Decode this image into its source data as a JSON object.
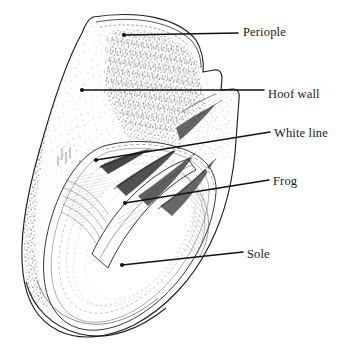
{
  "figure": {
    "subject": "hoof",
    "view": "sole view",
    "style": "pen-and-ink stipple and hatching line art",
    "background_color": "#ffffff",
    "ink_color": "#1a1a1a",
    "width": 349,
    "height": 353
  },
  "labels": [
    {
      "id": "periople",
      "text": "Periople",
      "leader": {
        "dot_x": 124,
        "dot_y": 35,
        "end_x": 238,
        "end_y": 33
      }
    },
    {
      "id": "hoof-wall",
      "text": "Hoof wall",
      "leader": {
        "dot_x": 82,
        "dot_y": 90,
        "end_x": 264,
        "end_y": 90
      }
    },
    {
      "id": "white-line",
      "text": "White line",
      "leader": {
        "dot_x": 96,
        "dot_y": 160,
        "end_x": 270,
        "end_y": 132
      }
    },
    {
      "id": "frog",
      "text": "Frog",
      "leader": {
        "dot_x": 125,
        "dot_y": 203,
        "end_x": 269,
        "end_y": 180
      }
    },
    {
      "id": "sole",
      "text": "Sole",
      "leader": {
        "dot_x": 122,
        "dot_y": 265,
        "end_x": 243,
        "end_y": 252
      }
    }
  ],
  "anatomy_parts": [
    "Periople",
    "Hoof wall",
    "White line",
    "Frog",
    "Sole"
  ]
}
